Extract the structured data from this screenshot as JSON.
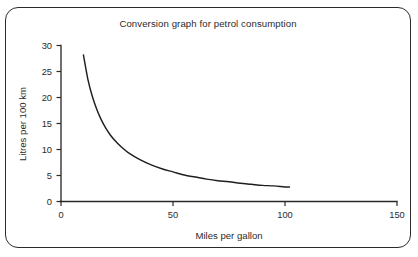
{
  "chart_data": {
    "type": "line",
    "title": "Conversion graph for petrol consumption",
    "xlabel": "Miles per gallon",
    "ylabel": "Litres per 100 km",
    "xlim": [
      0,
      150
    ],
    "ylim": [
      0,
      30
    ],
    "xticks": [
      0,
      50,
      100,
      150
    ],
    "yticks": [
      0,
      5,
      10,
      15,
      20,
      25,
      30
    ],
    "grid": false,
    "legend": null,
    "series": [
      {
        "name": "Petrol consumption conversion",
        "relation": "litres_per_100km = 282.5 / miles_per_gallon",
        "x": [
          10,
          12,
          14,
          16,
          18,
          20,
          22,
          25,
          28,
          30,
          35,
          40,
          45,
          50,
          55,
          60,
          65,
          70,
          75,
          80,
          85,
          90,
          95,
          100,
          102
        ],
        "y": [
          28.2,
          23.5,
          20.2,
          17.7,
          15.7,
          14.1,
          12.8,
          11.3,
          10.1,
          9.4,
          8.1,
          7.1,
          6.3,
          5.7,
          5.1,
          4.7,
          4.3,
          4.0,
          3.8,
          3.5,
          3.3,
          3.1,
          3.0,
          2.8,
          2.8
        ]
      }
    ]
  },
  "axis_ticks": {
    "x": [
      "0",
      "50",
      "100",
      "150"
    ],
    "y": [
      "0",
      "5",
      "10",
      "15",
      "20",
      "25",
      "30"
    ]
  },
  "colors": {
    "frame": "#2b2b2b",
    "axis": "#2b2b2b",
    "curve": "#1f1f1f",
    "background": "#ffffff"
  }
}
